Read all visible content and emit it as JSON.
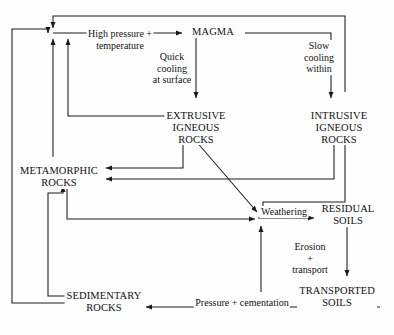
{
  "diagram": {
    "stroke_color": "#1a1a1a",
    "background_color": "#fefefe",
    "nodes": [
      {
        "id": "magma",
        "label": "MAGMA",
        "x": 213,
        "y": 26
      },
      {
        "id": "extrusive",
        "label": "EXTRUSIVE\nIGNEOUS\nROCKS",
        "x": 196,
        "y": 110
      },
      {
        "id": "intrusive",
        "label": "INTRUSIVE\nIGNEOUS\nROCKS",
        "x": 339,
        "y": 110
      },
      {
        "id": "metamorphic",
        "label": "METAMORPHIC\nROCKS",
        "x": 59,
        "y": 165
      },
      {
        "id": "residual",
        "label": "RESIDUAL\nSOILS",
        "x": 348,
        "y": 209
      },
      {
        "id": "transported",
        "label": "TRANSPORTED\nSOILS",
        "x": 337,
        "y": 290
      },
      {
        "id": "sedimentary",
        "label": "SEDIMENTARY\nROCKS",
        "x": 104,
        "y": 294
      }
    ],
    "edge_labels": [
      {
        "id": "high-pressure-temperature",
        "label": "High pressure +\ntemperature",
        "x": 120,
        "y": 28
      },
      {
        "id": "quick-cooling",
        "label": "Quick\ncooling\nat surface",
        "x": 172,
        "y": 53
      },
      {
        "id": "slow-cooling",
        "label": "Slow\ncooling\nwithin",
        "x": 319,
        "y": 41
      },
      {
        "id": "weathering",
        "label": "Weathering",
        "x": 278,
        "y": 209
      },
      {
        "id": "erosion-transport",
        "label": "Erosion\n+\ntransport",
        "x": 310,
        "y": 244
      },
      {
        "id": "pressure-cementation",
        "label": "Pressure + cementation",
        "x": 242,
        "y": 300
      }
    ],
    "relations": [
      "Metamorphic rocks, sedimentary rocks and extrusive/intrusive igneous rocks melt under High pressure + temperature to MAGMA",
      "MAGMA to EXTRUSIVE IGNEOUS ROCKS via Quick cooling at surface",
      "MAGMA to INTRUSIVE IGNEOUS ROCKS via Slow cooling within",
      "EXTRUSIVE IGNEOUS ROCKS to METAMORPHIC ROCKS",
      "INTRUSIVE IGNEOUS ROCKS to METAMORPHIC ROCKS",
      "EXTRUSIVE IGNEOUS ROCKS to Weathering",
      "INTRUSIVE IGNEOUS ROCKS to Weathering",
      "METAMORPHIC ROCKS to Weathering",
      "SEDIMENTARY ROCKS to Weathering",
      "Weathering to RESIDUAL SOILS",
      "RESIDUAL SOILS to TRANSPORTED SOILS via Erosion + transport",
      "TRANSPORTED SOILS to SEDIMENTARY ROCKS via Pressure + cementation",
      "SEDIMENTARY ROCKS to METAMORPHIC ROCKS"
    ]
  }
}
